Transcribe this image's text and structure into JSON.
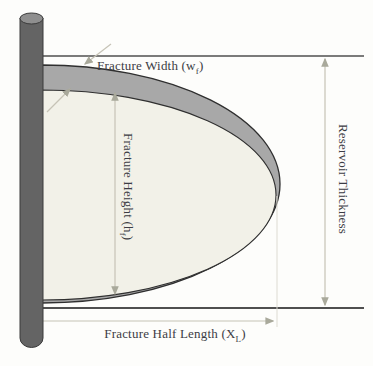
{
  "diagram": {
    "type": "fracture-geometry-schematic",
    "labels": {
      "fracture_width": {
        "pre": "Fracture Width (w",
        "sub": "f",
        "post": ")"
      },
      "fracture_height": {
        "pre": "Fracture Height (h",
        "sub": "f",
        "post": ")"
      },
      "reservoir_thickness": {
        "text": "Reservoir Thickness"
      },
      "fracture_half_length": {
        "pre": "Fracture Half Length (X",
        "sub": "L",
        "post": ")"
      }
    },
    "colors": {
      "background": "#fdfdfb",
      "wellbore": "#646464",
      "wellbore_cap": "#8f8f8f",
      "fracture_band": "#a8a8a8",
      "fracture_fill": "#f2f1e8",
      "outline": "#2f2f2f",
      "boundary_line": "#4f4f4f",
      "dimension_line": "#c6c3b6",
      "arrowhead": "#a9a99b",
      "text": "#3c3c44"
    }
  }
}
